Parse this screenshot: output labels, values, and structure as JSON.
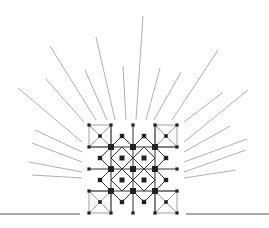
{
  "diagram": {
    "title": "",
    "colors": {
      "ray": "#9a9a9a",
      "lattice": "#333333",
      "node": "#222222",
      "base": "#555555"
    },
    "grid": {
      "x0": 89,
      "y0": 125,
      "cell": 22,
      "cols": 4,
      "rows": 4
    },
    "rays": [
      [
        143,
        16,
        136,
        120
      ],
      [
        96,
        37,
        115,
        120
      ],
      [
        50,
        46,
        96,
        120
      ],
      [
        85,
        70,
        107,
        120
      ],
      [
        123,
        66,
        126,
        120
      ],
      [
        160,
        68,
        146,
        120
      ],
      [
        181,
        72,
        154,
        120
      ],
      [
        218,
        50,
        172,
        120
      ],
      [
        18,
        88,
        82,
        142
      ],
      [
        46,
        79,
        84,
        122
      ],
      [
        35,
        130,
        82,
        152
      ],
      [
        32,
        143,
        82,
        162
      ],
      [
        29,
        162,
        82,
        172
      ],
      [
        32,
        175,
        82,
        178
      ],
      [
        248,
        90,
        184,
        142
      ],
      [
        222,
        93,
        184,
        122
      ],
      [
        230,
        126,
        184,
        152
      ],
      [
        247,
        139,
        184,
        162
      ],
      [
        246,
        150,
        184,
        172
      ],
      [
        236,
        170,
        184,
        178
      ]
    ],
    "base": [
      [
        0,
        214,
        80,
        214
      ],
      [
        186,
        214,
        269,
        214
      ]
    ]
  }
}
